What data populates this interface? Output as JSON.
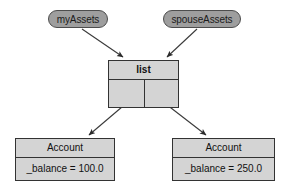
{
  "diagram": {
    "type": "uml-object-diagram",
    "background_color": "#ffffff",
    "box_fill": "#d4d4d4",
    "tag_fill": "#9e9e9e",
    "line_color": "#333333"
  },
  "variables": [
    {
      "id": "myassets",
      "label": "myAssets"
    },
    {
      "id": "spouseassets",
      "label": "spouseAssets"
    }
  ],
  "objects": {
    "list": {
      "title": "list",
      "slots": [
        {
          "label": ""
        },
        {
          "label": ""
        }
      ]
    },
    "account_left": {
      "title": "Account",
      "field": "_balance = 100.0"
    },
    "account_right": {
      "title": "Account",
      "field": "_balance = 250.0"
    }
  },
  "edges": [
    {
      "from": "myAssets",
      "to": "list"
    },
    {
      "from": "spouseAssets",
      "to": "list"
    },
    {
      "from": "list.slot0",
      "to": "Account _balance = 100.0"
    },
    {
      "from": "list.slot1",
      "to": "Account _balance = 250.0"
    }
  ]
}
